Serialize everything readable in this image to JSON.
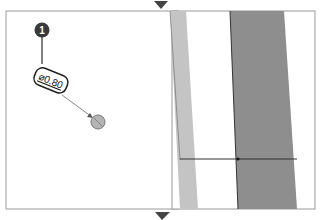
{
  "diagram": {
    "callout": {
      "number": "1",
      "dimension_symbol": "⌀",
      "dimension_value": "0.80"
    },
    "markers": {
      "top": "down-triangle",
      "bottom": "down-triangle"
    },
    "colors": {
      "frame": "#9a9a9a",
      "callout_fill": "#3a3a3a",
      "point_fill": "#b0b0b0",
      "light_band": "#c4c4c4",
      "dark_band": "#8a8a8a",
      "line": "#333333"
    }
  }
}
